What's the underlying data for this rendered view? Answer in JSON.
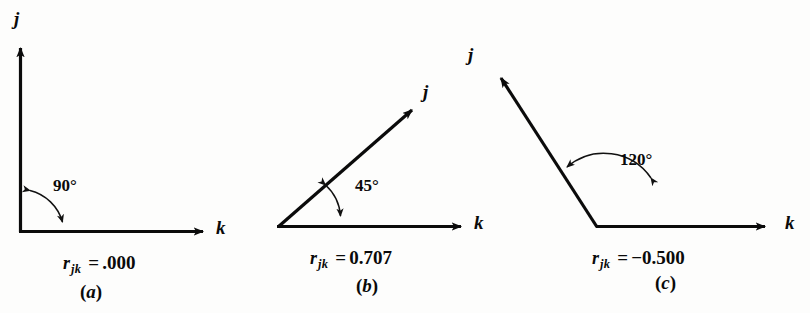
{
  "figure": {
    "background_color": "#fdfdfc",
    "ink_color": "#0b0b0b"
  },
  "panels": [
    {
      "id": "a",
      "caption_open": "(",
      "caption_letter": "a",
      "caption_close": ")",
      "angle_label": "90°",
      "angle_degrees": 90,
      "j_label": "j",
      "k_label": "k",
      "r_symbol": "r",
      "r_subscript": "jk",
      "r_equals": "=",
      "r_value": ".000"
    },
    {
      "id": "b",
      "caption_open": "(",
      "caption_letter": "b",
      "caption_close": ")",
      "angle_label": "45°",
      "angle_degrees": 45,
      "j_label": "j",
      "k_label": "k",
      "r_symbol": "r",
      "r_subscript": "jk",
      "r_equals": "=",
      "r_value": "0.707"
    },
    {
      "id": "c",
      "caption_open": "(",
      "caption_letter": "c",
      "caption_close": ")",
      "angle_label": "120°",
      "angle_degrees": 120,
      "j_label": "j",
      "k_label": "k",
      "r_symbol": "r",
      "r_subscript": "jk",
      "r_equals": "=",
      "r_value": "−0.500"
    }
  ]
}
